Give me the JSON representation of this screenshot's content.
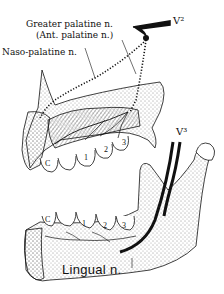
{
  "figure": {
    "upper": {
      "labels": {
        "greater_palatine": "Greater palatine n.",
        "ant_palatine": "(Ant. palatine n.)",
        "naso_palatine": "Naso-palatine n.",
        "v2": "V²"
      },
      "teeth": [
        "C",
        "1",
        "2",
        "3"
      ]
    },
    "lower": {
      "labels": {
        "v3": "V³",
        "lingual": "Lingual n."
      },
      "teeth": [
        "C",
        "1",
        "2",
        "3"
      ]
    },
    "colors": {
      "ink": "#111111",
      "background": "#ffffff"
    }
  }
}
